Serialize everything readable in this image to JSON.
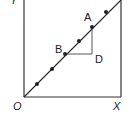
{
  "diagram": {
    "labels": {
      "origin": "O",
      "x_axis": "X",
      "y_axis": "Y",
      "point_a": "A",
      "point_b": "B",
      "point_d": "D"
    },
    "colors": {
      "line": "#222222",
      "background": "#ffffff"
    },
    "line_points": [
      [
        37,
        84
      ],
      [
        52,
        69
      ],
      [
        65,
        54
      ],
      [
        79,
        41
      ],
      [
        92,
        27
      ],
      [
        106,
        12
      ]
    ]
  }
}
